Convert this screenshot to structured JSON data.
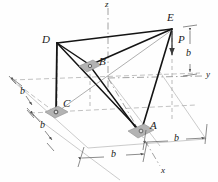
{
  "figure": {
    "type": "space-truss-free-body-diagram",
    "nodes": [
      {
        "id": "A",
        "label": "A",
        "x": 141,
        "y": 133,
        "support": true
      },
      {
        "id": "B",
        "label": "B",
        "x": 90,
        "y": 65,
        "support": true
      },
      {
        "id": "C",
        "label": "C",
        "x": 56,
        "y": 113,
        "support": true
      },
      {
        "id": "D",
        "label": "D",
        "x": 57,
        "y": 43,
        "support": false
      },
      {
        "id": "E",
        "label": "E",
        "x": 172,
        "y": 29,
        "support": false
      }
    ],
    "node_labels": [
      {
        "text": "A",
        "x": 150,
        "y": 126
      },
      {
        "text": "B",
        "x": 99,
        "y": 62
      },
      {
        "text": "C",
        "x": 63,
        "y": 104
      },
      {
        "text": "D",
        "x": 44,
        "y": 36
      },
      {
        "text": "E",
        "x": 168,
        "y": 14
      }
    ],
    "force": {
      "label": "P",
      "x": 178,
      "y": 40,
      "arrow_from_x": 172,
      "arrow_from_y": 31,
      "arrow_to_x": 172,
      "arrow_to_y": 57,
      "direction": "downward"
    },
    "axes": [
      {
        "label": "z",
        "x": 108,
        "y": 2
      },
      {
        "label": "y",
        "x": 207,
        "y": 77
      },
      {
        "label": "x",
        "x": 163,
        "y": 170
      }
    ],
    "dimensions": [
      {
        "label": "b",
        "x": 22,
        "y": 88
      },
      {
        "label": "b",
        "x": 42,
        "y": 130
      },
      {
        "label": "b",
        "x": 112,
        "y": 155
      },
      {
        "label": "b",
        "x": 176,
        "y": 142
      },
      {
        "label": "b",
        "x": 189,
        "y": 55
      }
    ],
    "colors": {
      "line": "#1a1a1a",
      "grid": "#9a9a9a",
      "support_fill": "#b0b0b0",
      "background": "#ffffff"
    }
  }
}
